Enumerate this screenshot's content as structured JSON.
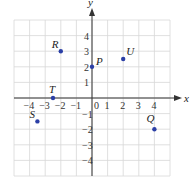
{
  "chart_data": {
    "type": "scatter",
    "title": "",
    "xlabel": "x",
    "ylabel": "y",
    "xlim": [
      -5,
      5
    ],
    "ylim": [
      -5,
      5
    ],
    "grid": true,
    "x_ticks": [
      "-4",
      "-3",
      "-2",
      "-1",
      "0",
      "1",
      "2",
      "3",
      "4"
    ],
    "y_ticks": [
      "4",
      "3",
      "2",
      "1",
      "-1",
      "-2",
      "-3",
      "-4"
    ],
    "points": [
      {
        "label": "P",
        "x": 0,
        "y": 2
      },
      {
        "label": "U",
        "x": 2,
        "y": 2.5
      },
      {
        "label": "R",
        "x": -2,
        "y": 3
      },
      {
        "label": "T",
        "x": -2.5,
        "y": 0
      },
      {
        "label": "S",
        "x": -3.5,
        "y": -1.5
      },
      {
        "label": "Q",
        "x": 4,
        "y": -2
      }
    ],
    "point_color": "#2b3fa6",
    "grid_color": "#d8d8d8",
    "axis_color": "#333333"
  },
  "axes": {
    "x_label": "x",
    "y_label": "y",
    "origin_label": "0"
  }
}
